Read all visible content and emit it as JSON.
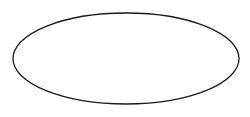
{
  "canvas": {
    "width": 250,
    "height": 117,
    "background_color": "#ffffff",
    "title": "Ellipse outline"
  },
  "shapes": [
    {
      "name": "ellipse",
      "type": "ellipse",
      "label": "",
      "center_x": 126,
      "center_y": 58.5,
      "radius_x": 113,
      "radius_y": 45.5,
      "bounds": {
        "left": 13,
        "top": 13,
        "right": 239,
        "bottom": 104
      },
      "stroke_color": "#1a1a1a",
      "stroke_width": 1.3,
      "fill_color": "none",
      "rotation_deg": 0
    }
  ],
  "annotations": {
    "text_items": [],
    "count": 0
  }
}
